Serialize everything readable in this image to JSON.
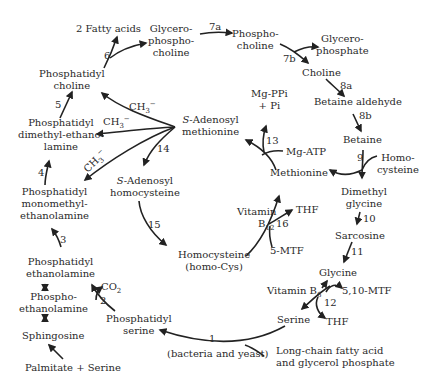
{
  "diagram": {
    "colors": {
      "text": "#2a2a2a",
      "arrow": "#222222",
      "background": "#ffffff"
    },
    "nodes": {
      "fatty_acids": "2 Fatty acids",
      "glycerophosphocholine": [
        "Glycero-",
        "phospho-",
        "choline"
      ],
      "phosphocholine": [
        "Phospho-",
        "choline"
      ],
      "glycerophosphate": [
        "Glycero-",
        "phosphate"
      ],
      "choline": "Choline",
      "betaine_aldehyde": "Betaine aldehyde",
      "betaine": "Betaine",
      "homocysteine_right": [
        "Homo-",
        "cysteine"
      ],
      "dimethylglycine": [
        "Dimethyl",
        "glycine"
      ],
      "sarcosine": "Sarcosine",
      "glycine": "Glycine",
      "vitamin_b6": "Vitamin B",
      "vitamin_b6_sub": "6",
      "mtf_5_10": "5,10-MTF",
      "thf_bottom": "THF",
      "serine": "Serine",
      "long_chain": [
        "Long-chain fatty acid",
        "and glycerol phosphate"
      ],
      "bacteria_yeast": "(bacteria and yeast)",
      "phosphatidylserine": [
        "Phosphatidyl",
        "serine"
      ],
      "co2": "CO",
      "co2_sub": "2",
      "phosphatidylethanolamine": [
        "Phosphatidyl",
        "ethanolamine"
      ],
      "phosphoethanolamine": [
        "Phospho-",
        "ethanolamine"
      ],
      "sphingosine": "Sphingosine",
      "palmitate_serine": "Palmitate + Serine",
      "phosphatidylmonomethyl": [
        "Phosphatidyl",
        "monomethyl-",
        "ethanolamine"
      ],
      "phosphatidyldimethyl": [
        "Phosphatidyl",
        "dimethyl-ethano-",
        "lamine"
      ],
      "phosphatidylcholine": [
        "Phosphatidyl",
        "choline"
      ],
      "sam_prefix": "S",
      "sam": [
        "-Adenosyl",
        "methionine"
      ],
      "sah_prefix": "S",
      "sah": [
        "-Adenosyl",
        "homocysteine"
      ],
      "homocysteine_center": [
        "Homocysteine",
        "(homo-Cys)"
      ],
      "mg_ppi": [
        "Mg-PPi",
        "+ Pi"
      ],
      "mg_atp": "Mg-ATP",
      "methionine": "Methionine",
      "vitamin_b12": "Vitamin",
      "vitamin_b12_b": "B",
      "vitamin_b12_sub": "12",
      "thf_center": "THF",
      "mtf_5": "5-MTF",
      "ch3_base": "CH",
      "ch3_sub": "3",
      "ch3_sup": "−"
    },
    "step_numbers": {
      "s1": "1",
      "s2": "2",
      "s3": "3",
      "s4": "4",
      "s5": "5",
      "s6": "6",
      "s7a": "7a",
      "s7b": "7b",
      "s8a": "8a",
      "s8b": "8b",
      "s9": "9",
      "s10": "10",
      "s11": "11",
      "s12": "12",
      "s13": "13",
      "s14": "14",
      "s15": "15",
      "s16": "16"
    }
  }
}
